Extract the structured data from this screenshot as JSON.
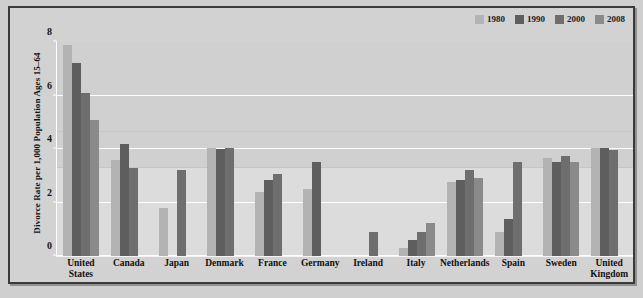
{
  "chart_data": {
    "type": "bar",
    "title": "",
    "subtitle": "",
    "xlabel": "",
    "ylabel": "Divorce Rate per 1,000 Population Ages 15–64",
    "ylim": [
      0,
      8
    ],
    "yticks": [
      0,
      2,
      4,
      6,
      8
    ],
    "ytick_labels": [
      "0",
      "2",
      "4",
      "6",
      "8"
    ],
    "grid": true,
    "legend_position": "top-right",
    "categories": [
      "United States",
      "Canada",
      "Japan",
      "Denmark",
      "France",
      "Germany",
      "Ireland",
      "Italy",
      "Netherlands",
      "Spain",
      "Sweden",
      "United Kingdom"
    ],
    "series": [
      {
        "name": "1980",
        "color": "#b3b3b3",
        "values": [
          7.9,
          3.6,
          1.8,
          4.05,
          2.4,
          2.5,
          null,
          0.3,
          2.75,
          0.9,
          3.65,
          4.05
        ]
      },
      {
        "name": "1990",
        "color": "#5e5e5e",
        "values": [
          7.2,
          4.2,
          null,
          4.0,
          2.85,
          3.5,
          null,
          0.6,
          2.85,
          1.4,
          3.5,
          4.05
        ]
      },
      {
        "name": "2000",
        "color": "#6e6e6e",
        "values": [
          6.1,
          3.3,
          3.2,
          4.05,
          3.05,
          null,
          0.9,
          0.9,
          3.2,
          3.5,
          3.75,
          3.95
        ]
      },
      {
        "name": "2008",
        "color": "#8a8a8a",
        "values": [
          5.1,
          null,
          null,
          null,
          null,
          null,
          null,
          1.25,
          2.9,
          null,
          3.5,
          null
        ]
      }
    ]
  },
  "legend": {
    "items": [
      {
        "label": "1980",
        "color": "#b3b3b3"
      },
      {
        "label": "1990",
        "color": "#5e5e5e"
      },
      {
        "label": "2000",
        "color": "#6e6e6e"
      },
      {
        "label": "2008",
        "color": "#8a8a8a"
      }
    ]
  },
  "axis": {
    "y_title": "Divorce Rate per 1,000 Population Ages 15–64",
    "y_ticks": [
      "8",
      "6",
      "4",
      "2",
      "0"
    ]
  },
  "colors": {
    "plot_background": "#d0d0d0",
    "plot_background_lower": "#dcdcdc",
    "page_background": "#cfcfcf",
    "frame_border": "#3a3a3a",
    "gridline": "#fdfdfd",
    "text": "#111111"
  }
}
